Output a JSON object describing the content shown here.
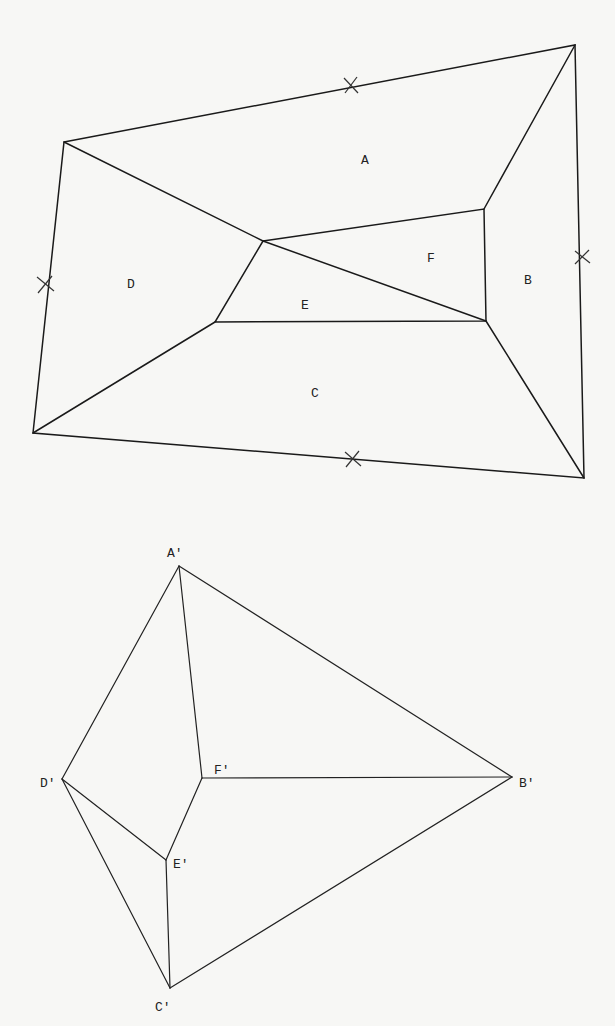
{
  "map_figure": {
    "regions": [
      {
        "id": "A",
        "label": "A",
        "x": 367,
        "y": 160
      },
      {
        "id": "B",
        "label": "B",
        "x": 530,
        "y": 280
      },
      {
        "id": "C",
        "label": "C",
        "x": 317,
        "y": 393
      },
      {
        "id": "D",
        "label": "D",
        "x": 133,
        "y": 284
      },
      {
        "id": "E",
        "label": "E",
        "x": 307,
        "y": 305
      },
      {
        "id": "F",
        "label": "F",
        "x": 433,
        "y": 258
      }
    ],
    "vertices": {
      "outer_tl": [
        64,
        142
      ],
      "outer_tr": [
        575,
        45
      ],
      "outer_br": [
        584,
        478
      ],
      "outer_bl": [
        33,
        433
      ],
      "inner_p": [
        263,
        241
      ],
      "inner_q": [
        484,
        209
      ],
      "inner_r": [
        486,
        321
      ],
      "inner_s": [
        215,
        322
      ]
    },
    "boundary_marks": [
      {
        "name": "top-mark",
        "x": 351,
        "y": 85
      },
      {
        "name": "right-mark",
        "x": 582,
        "y": 257
      },
      {
        "name": "bottom-mark",
        "x": 353,
        "y": 459
      },
      {
        "name": "left-mark",
        "x": 45,
        "y": 284
      }
    ]
  },
  "dual_graph": {
    "nodes": [
      {
        "id": "A'",
        "label": "A'",
        "x": 179,
        "y": 566,
        "label_x": 169,
        "label_y": 555
      },
      {
        "id": "B'",
        "label": "B'",
        "x": 512,
        "y": 777,
        "label_x": 521,
        "label_y": 783
      },
      {
        "id": "C'",
        "label": "C'",
        "x": 170,
        "y": 988,
        "label_x": 157,
        "label_y": 1008
      },
      {
        "id": "D'",
        "label": "D'",
        "x": 62,
        "y": 779,
        "label_x": 41,
        "label_y": 783
      },
      {
        "id": "E'",
        "label": "E'",
        "x": 166,
        "y": 860,
        "label_x": 174,
        "label_y": 864
      },
      {
        "id": "F'",
        "label": "F'",
        "x": 202,
        "y": 778,
        "label_x": 215,
        "label_y": 770
      }
    ],
    "edges": [
      [
        "A'",
        "B'"
      ],
      [
        "A'",
        "D'"
      ],
      [
        "A'",
        "F'"
      ],
      [
        "F'",
        "B'"
      ],
      [
        "F'",
        "E'"
      ],
      [
        "D'",
        "E'"
      ],
      [
        "D'",
        "C'"
      ],
      [
        "E'",
        "C'"
      ],
      [
        "C'",
        "B'"
      ]
    ]
  }
}
